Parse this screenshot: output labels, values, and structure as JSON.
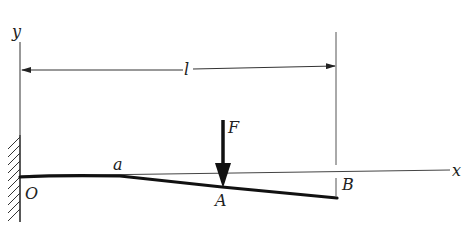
{
  "figure": {
    "type": "cantilever-beam-deflection",
    "labels": {
      "y_axis": "y",
      "x_axis": "x",
      "length": "l",
      "force": "F",
      "origin": "O",
      "point_a": "a",
      "point_A": "A",
      "point_B": "B"
    },
    "colors": {
      "ink": "#111111",
      "thin_line": "#444444",
      "background": "#ffffff"
    }
  }
}
